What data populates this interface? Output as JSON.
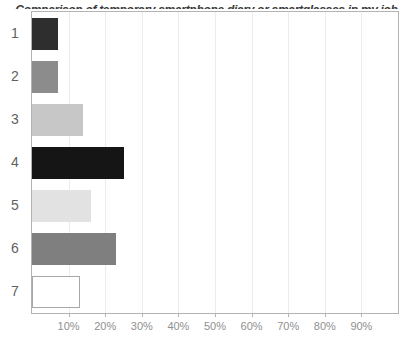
{
  "chart_data": {
    "type": "bar",
    "orientation": "horizontal",
    "title": "Comparison of temporary smartphone diary or smartglasses in my job",
    "title_clipped_at_top": true,
    "categories": [
      "1",
      "2",
      "3",
      "4",
      "5",
      "6",
      "7"
    ],
    "values": [
      7,
      7,
      14,
      25,
      16,
      23,
      13
    ],
    "unit": "%",
    "xlabel": "",
    "ylabel": "",
    "xlim": [
      0,
      100
    ],
    "x_tick_values": [
      10,
      20,
      30,
      40,
      50,
      60,
      70,
      80,
      90
    ],
    "x_tick_labels": [
      "10%",
      "20%",
      "30%",
      "40%",
      "50%",
      "60%",
      "70%",
      "80%",
      "90%"
    ],
    "grid": "vertical",
    "legend": "none",
    "bar_colors": [
      "#2e2e2e",
      "#8c8c8c",
      "#c7c7c7",
      "#151515",
      "#e2e2e2",
      "#7f7f7f",
      "#ffffff"
    ],
    "bar_border_colors": [
      "",
      "",
      "",
      "",
      "",
      "",
      "#a8a8a8"
    ]
  },
  "colors": {
    "background": "#ffffff",
    "plot_border": "#b3b3b3",
    "gridline": "#ececec",
    "category_label": "#5f5f5f",
    "tick_label": "#8f8f8f",
    "title_text": "#3a3a3a"
  }
}
